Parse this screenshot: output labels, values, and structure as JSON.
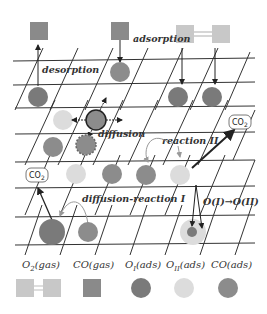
{
  "diagram": {
    "type": "surface-reaction-lattice",
    "labels": {
      "adsorption": "adsorption",
      "desorption": "desorption",
      "diffusion": "diffusion",
      "reaction_ii": "reaction II",
      "diffusion_reaction_i": "diffusion-reaction I",
      "transition": "O(I)→O(II)",
      "co2_left": "CO",
      "co2_right": "CO",
      "co2_sub": "2"
    },
    "colors": {
      "grid": "#333333",
      "co_gas": "#8a8a8a",
      "o2_gas": "#c8c8c8",
      "o_i": "#7a7a7a",
      "o_ii": "#dcdcdc",
      "co_ads": "#8c8c8c",
      "arrow": "#222222",
      "arrow_light": "#999999"
    },
    "legend": [
      {
        "label": "O₂(gas)",
        "main": "O",
        "sub": "2",
        "rest": "(gas)",
        "shape": "double-square"
      },
      {
        "label": "CO(gas)",
        "main": "CO(gas)",
        "sub": "",
        "rest": "",
        "shape": "square"
      },
      {
        "label": "O_I(ads)",
        "main": "O",
        "sub": "I",
        "rest": "(ads)",
        "shape": "circle-dark"
      },
      {
        "label": "O_II(ads)",
        "main": "O",
        "sub": "II",
        "rest": "(ads)",
        "shape": "circle-light"
      },
      {
        "label": "CO(ads)",
        "main": "CO(ads)",
        "sub": "",
        "rest": "",
        "shape": "circle-mid"
      }
    ]
  }
}
